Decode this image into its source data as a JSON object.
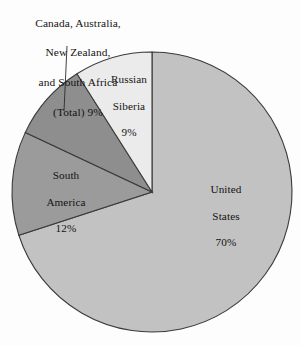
{
  "chart_data": {
    "type": "pie",
    "title": "",
    "subtitle": "",
    "xlabel": "",
    "ylabel": "",
    "legend_position": "none",
    "grid": false,
    "unit": "%",
    "categories": [
      "United States",
      "Russian Siberia",
      "Canada, Australia, New Zealand, and South Africa (Total)",
      "South America"
    ],
    "values": [
      70,
      9,
      9,
      12
    ],
    "slices": [
      {
        "name": "United States",
        "label_lines": [
          "United",
          "States",
          "70%"
        ],
        "value": 70,
        "value_text": "70%",
        "color": "#c2c2c2",
        "start_angle_deg": 0,
        "end_angle_deg": 252,
        "label_x": 226,
        "label_y": 192,
        "has_leader": false
      },
      {
        "name": "South America",
        "label_lines": [
          "South",
          "America",
          "12%"
        ],
        "value": 12,
        "value_text": "12%",
        "color": "#9b9b9b",
        "start_angle_deg": 252,
        "end_angle_deg": 295.2,
        "label_x": 66,
        "label_y": 192,
        "has_leader": false
      },
      {
        "name": "Canada, Australia, New Zealand, and South Africa (Total)",
        "label_lines": [
          "Canada, Australia,",
          "New Zealand,",
          "and South Africa",
          "(Total)  9%"
        ],
        "value": 9,
        "value_text": "9%",
        "color": "#8e8e8e",
        "start_angle_deg": 295.2,
        "end_angle_deg": 327.6,
        "label_x": 78,
        "label_y": 30,
        "has_leader": true
      },
      {
        "name": "Russian Siberia",
        "label_lines": [
          "Russian",
          "Siberia",
          "9%"
        ],
        "value": 9,
        "value_text": "9%",
        "color": "#ebebeb",
        "start_angle_deg": 327.6,
        "end_angle_deg": 360,
        "label_x": 129,
        "label_y": 88,
        "has_leader": false
      }
    ],
    "geometry": {
      "center_x": 152,
      "center_y": 192,
      "radius": 140
    },
    "colors": {
      "background": "#fdfdfd",
      "outline": "#3a3a3a",
      "text": "#141414",
      "united_states": "#c2c2c2",
      "russian_siberia": "#ebebeb",
      "canada_group": "#8e8e8e",
      "south_america": "#9b9b9b"
    },
    "leader_line": {
      "x1": 67,
      "y1": 46,
      "x2": 64,
      "y2": 111
    }
  },
  "labels": {
    "canada": {
      "line1": "Canada, Australia,",
      "line2": "New Zealand,",
      "line3": "and South Africa",
      "line4": "(Total)  9%"
    },
    "russia": {
      "line1": "Russian",
      "line2": "Siberia",
      "line3": "9%"
    },
    "south_america": {
      "line1": "South",
      "line2": "America",
      "line3": "12%"
    },
    "united_states": {
      "line1": "United",
      "line2": "States",
      "line3": "70%"
    }
  }
}
